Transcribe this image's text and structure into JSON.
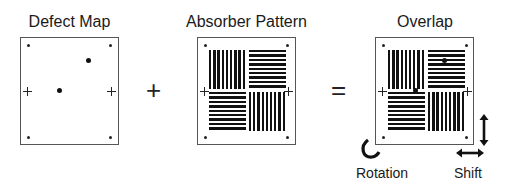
{
  "panels": {
    "defect_map": {
      "title": "Defect Map"
    },
    "absorber_pattern": {
      "title": "Absorber Pattern"
    },
    "overlap": {
      "title": "Overlap"
    }
  },
  "operators": {
    "plus": "+",
    "equals": "="
  },
  "annotations": {
    "rotation": "Rotation",
    "shift": "Shift"
  },
  "colors": {
    "line": "#555555",
    "ink": "#111111",
    "background": "#ffffff"
  }
}
